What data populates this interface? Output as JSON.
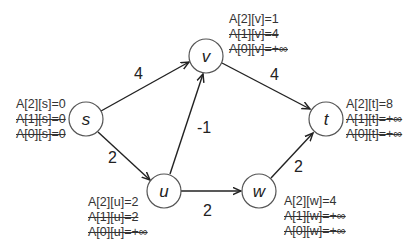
{
  "nodes": {
    "s": {
      "label": "s",
      "annotations": [
        "A[2][s]=0",
        "A[1][s]=0",
        "A[0][s]=0"
      ]
    },
    "v": {
      "label": "v",
      "annotations": [
        "A[2][v]=1",
        "A[1][v]=4",
        "A[0][v]=+∞"
      ]
    },
    "u": {
      "label": "u",
      "annotations": [
        "A[2][u]=2",
        "A[1][u]=2",
        "A[0][u]=+∞"
      ]
    },
    "w": {
      "label": "w",
      "annotations": [
        "A[2][w]=4",
        "A[1][w]=+∞",
        "A[0][w]=+∞"
      ]
    },
    "t": {
      "label": "t",
      "annotations": [
        "A[2][t]=8",
        "A[1][t]=+∞",
        "A[0][t]=+∞"
      ]
    }
  },
  "edges": [
    {
      "from": "s",
      "to": "v",
      "weight": "4"
    },
    {
      "from": "s",
      "to": "u",
      "weight": "2"
    },
    {
      "from": "u",
      "to": "v",
      "weight": "-1"
    },
    {
      "from": "u",
      "to": "w",
      "weight": "2"
    },
    {
      "from": "v",
      "to": "t",
      "weight": "4"
    },
    {
      "from": "w",
      "to": "t",
      "weight": "2"
    }
  ]
}
